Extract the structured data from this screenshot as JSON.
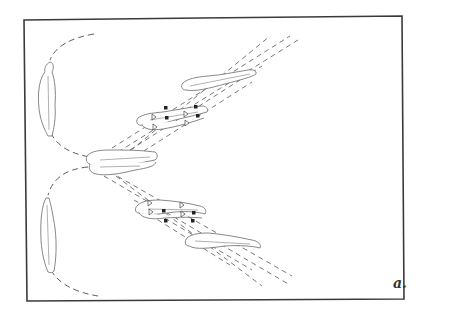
{
  "figure": {
    "label": "a.",
    "frame_color": "#3a3a3a",
    "stroke_color": "#6a6a6a",
    "background": "#ffffff"
  },
  "elements": {
    "figures": [
      {
        "name": "vertical-figure-top-left",
        "orientation": "vertical"
      },
      {
        "name": "horizontal-figure-center",
        "orientation": "horizontal"
      },
      {
        "name": "vertical-figure-bottom-left",
        "orientation": "vertical"
      },
      {
        "name": "upper-diagonal-figure-pair-with-markers",
        "orientation": "diagonal-up"
      },
      {
        "name": "upper-diagonal-figure-far",
        "orientation": "diagonal-up"
      },
      {
        "name": "lower-diagonal-figure-pair-with-markers",
        "orientation": "diagonal-down"
      },
      {
        "name": "lower-diagonal-figure-far",
        "orientation": "diagonal-down"
      }
    ],
    "markers": {
      "open_triangles": 8,
      "solid_squares": 8
    },
    "trajectories": {
      "dashed_arcs": 2,
      "dashed_trails_up": 5,
      "dashed_trails_down": 5
    }
  }
}
